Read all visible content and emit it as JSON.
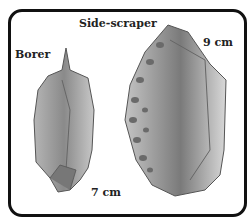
{
  "figure": {
    "labels": {
      "side_scraper": "Side-scraper",
      "borer": "Borer",
      "side_scraper_size": "9 cm",
      "borer_size": "7 cm"
    },
    "colors": {
      "border": "#111111",
      "stone_light": "#cfcfcf",
      "stone_mid": "#9a9a9a",
      "stone_dark": "#5e5e5e"
    }
  }
}
